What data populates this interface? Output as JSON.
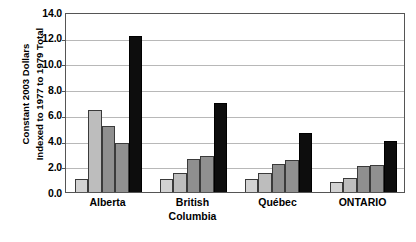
{
  "chart_data": {
    "type": "bar",
    "title": "",
    "subtitle": "",
    "xlabel": "",
    "ylabel": "Constant 2003 Dollars Indexed to 1977 to 1979 Total",
    "ylabel_lines": [
      "Constant 2003 Dollars",
      "Indexed to 1977 to 1979 Total"
    ],
    "categories": [
      "Alberta",
      "British Columbia",
      "Québec",
      "ONTARIO"
    ],
    "category_label_lines": [
      [
        "Alberta"
      ],
      [
        "British",
        "Columbia"
      ],
      [
        "Québec"
      ],
      [
        "ONTARIO"
      ]
    ],
    "ylim": [
      0.0,
      14.0
    ],
    "ytick_step": 2.0,
    "ytick_labels": [
      "14.0",
      "12.0",
      "10.0",
      "8.0",
      "6.0",
      "4.0",
      "2.0",
      "0.0"
    ],
    "ytick_values": [
      14.0,
      12.0,
      10.0,
      8.0,
      6.0,
      4.0,
      2.0,
      0.0
    ],
    "grid": true,
    "grid_axis": "y",
    "legend": false,
    "legend_position": "none",
    "series": [
      {
        "name": "Series 1",
        "color": "#d2d2d2",
        "values": [
          1.0,
          1.0,
          1.0,
          0.8
        ]
      },
      {
        "name": "Series 2",
        "color": "#bdbdbd",
        "values": [
          6.4,
          1.5,
          1.5,
          1.1
        ]
      },
      {
        "name": "Series 3",
        "color": "#8f8f8f",
        "values": [
          5.1,
          2.6,
          2.2,
          2.0
        ]
      },
      {
        "name": "Series 4",
        "color": "#909090",
        "values": [
          3.8,
          2.8,
          2.5,
          2.1
        ]
      },
      {
        "name": "Series 5",
        "color": "#0d0d0d",
        "values": [
          12.1,
          6.9,
          4.6,
          4.0
        ]
      }
    ],
    "colors": {
      "bar_1": "#d2d2d2",
      "bar_2": "#bdbdbd",
      "bar_3": "#8f8f8f",
      "bar_4": "#909090",
      "bar_5": "#0d0d0d",
      "bar_outline": "#3a3a3a",
      "gridline": "#b8b8b8",
      "axis": "#555555",
      "background": "#ffffff",
      "text": "#000000"
    }
  }
}
